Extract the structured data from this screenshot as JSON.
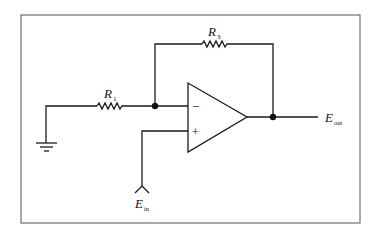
{
  "diagram": {
    "components": {
      "r1": {
        "label": "R",
        "subscript": "1"
      },
      "r3": {
        "label": "R",
        "subscript": "3"
      },
      "opamp": {
        "inverting_sign": "−",
        "noninverting_sign": "+"
      },
      "input": {
        "label": "E",
        "subscript": "in"
      },
      "output": {
        "label": "E",
        "subscript": "out"
      },
      "ground": {
        "name": "ground"
      }
    },
    "colors": {
      "line": "#1a1a1a",
      "border": "#555555",
      "background": "#ffffff"
    }
  }
}
